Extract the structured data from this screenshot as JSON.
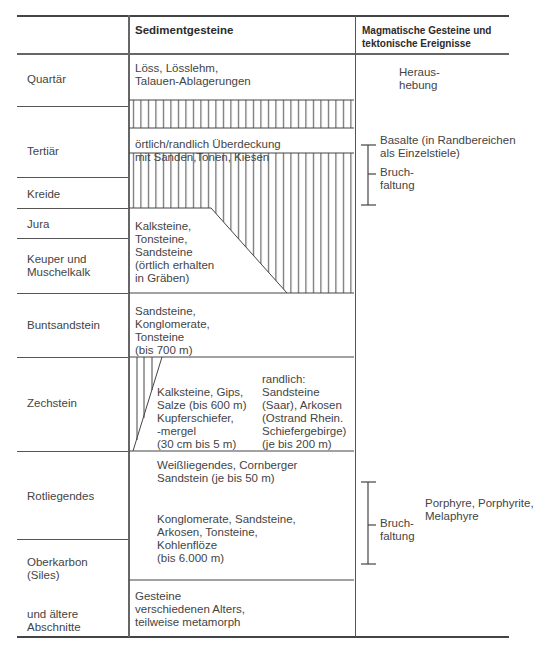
{
  "header": {
    "col1": "",
    "col2": "Sedimentgesteine",
    "col3": "Magmatische Gesteine und\ntektonische Ereignisse"
  },
  "periods": [
    {
      "label": "Quartär"
    },
    {
      "label": "Tertiär"
    },
    {
      "label": "Kreide"
    },
    {
      "label": "Jura"
    },
    {
      "label": "Keuper und\nMuschelkalk"
    },
    {
      "label": "Buntsandstein"
    },
    {
      "label": "Zechstein"
    },
    {
      "label": "Rotliegendes"
    },
    {
      "label": "Oberkarbon\n(Siles)"
    },
    {
      "label": "und ältere\nAbschnitte"
    }
  ],
  "sediments": {
    "quartaer": "Löss, Lösslehm,\nTalauen-Ablagerungen",
    "tertiaer": "örtlich/randlich Überdeckung\nmit Sanden,Tonen, Kiesen",
    "jura_keuper": "Kalksteine,\nTonsteine,\nSandsteine\n(örtlich erhalten\nin Gräben)",
    "buntsandstein": "Sandsteine,\nKonglomerate,\nTonsteine\n(bis 700 m)",
    "zechstein_left": "Kalksteine, Gips,\nSalze (bis 600 m)\nKupferschiefer,\n-mergel\n(30 cm bis 5 m)",
    "zechstein_right": "randlich:\nSandsteine\n(Saar), Arkosen\n(Ostrand Rhein.\nSchiefergebirge)\n(je bis 200 m)",
    "rotliegendes_top": "Weißliegendes, Cornberger\nSandstein (je bis 50 m)",
    "rotliegendes_main": "Konglomerate, Sandsteine,\nArkosen, Tonsteine,\nKohlenflöze\n(bis 6.000 m)",
    "aeltere": "Gesteine\nverschiedenen Alters,\nteilweise metamorph"
  },
  "magmatic": {
    "herausbehung": "Heraus-\nhebung",
    "basalte": "Basalte (in Randbereichen\nals Einzelstiele)",
    "bruch1": "Bruch-\nfaltung",
    "porphyre": "Porphyre, Porphyrite,\nMelaphyre",
    "bruch2": "Bruch-\nfaltung"
  }
}
